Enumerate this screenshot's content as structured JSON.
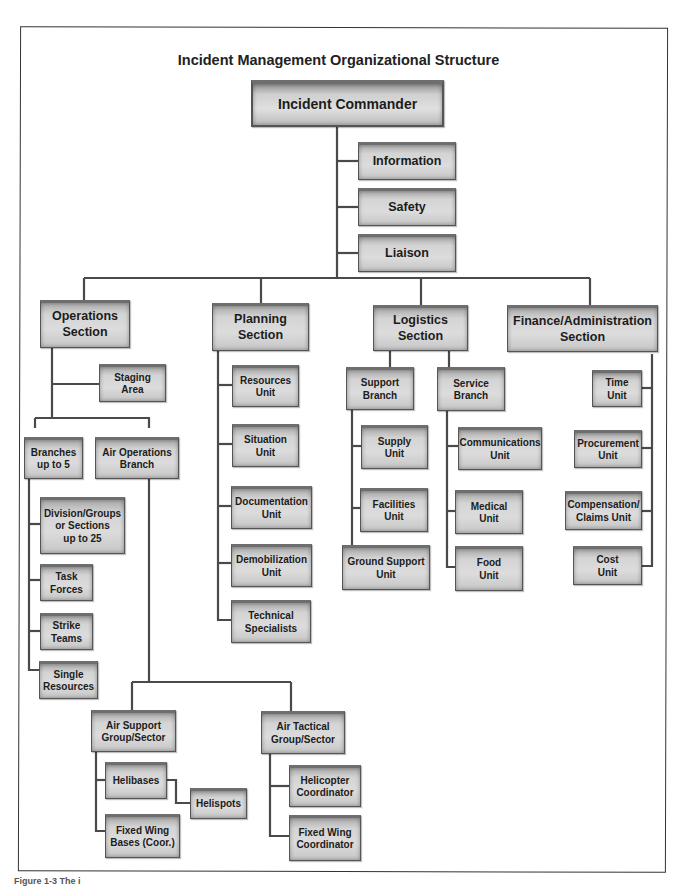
{
  "title": "Incident Management Organizational Structure",
  "caption": "Figure 1-3 The i",
  "nodes": {
    "incident_commander": "Incident Commander",
    "information": "Information",
    "safety": "Safety",
    "liaison": "Liaison",
    "operations_section": "Operations\nSection",
    "planning_section": "Planning\nSection",
    "logistics_section": "Logistics\nSection",
    "finance_section": "Finance/Administration\nSection",
    "staging_area": "Staging\nArea",
    "branches": "Branches\nup to 5",
    "air_operations_branch": "Air Operations\nBranch",
    "division_groups": "Division/Groups\nor Sections\nup to 25",
    "task_forces": "Task\nForces",
    "strike_teams": "Strike\nTeams",
    "single_resources": "Single\nResources",
    "air_support_group": "Air Support\nGroup/Sector",
    "air_tactical_group": "Air Tactical\nGroup/Sector",
    "helibases": "Helibases",
    "helispots": "Helispots",
    "fixed_wing_bases": "Fixed Wing\nBases (Coor.)",
    "helicopter_coordinator": "Helicopter\nCoordinator",
    "fixed_wing_coordinator": "Fixed Wing\nCoordinator",
    "resources_unit": "Resources\nUnit",
    "situation_unit": "Situation\nUnit",
    "documentation_unit": "Documentation\nUnit",
    "demobilization_unit": "Demobilization\nUnit",
    "technical_specialists": "Technical\nSpecialists",
    "support_branch": "Support\nBranch",
    "service_branch": "Service\nBranch",
    "supply_unit": "Supply\nUnit",
    "facilities_unit": "Facilities\nUnit",
    "ground_support_unit": "Ground Support\nUnit",
    "communications_unit": "Communications\nUnit",
    "medical_unit": "Medical\nUnit",
    "food_unit": "Food\nUnit",
    "time_unit": "Time\nUnit",
    "procurement_unit": "Procurement\nUnit",
    "compensation_claims_unit": "Compensation/\nClaims Unit",
    "cost_unit": "Cost\nUnit"
  }
}
